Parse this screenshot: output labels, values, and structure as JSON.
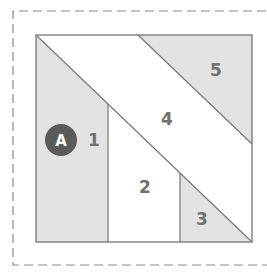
{
  "diagram": {
    "type": "quilt-block-piecing-diagram",
    "colors": {
      "background": "#ffffff",
      "shaded_fill": "#e2e2e2",
      "outline": "#777777",
      "dashed_border": "#8a8a8a",
      "label_text": "#707070",
      "badge_fill": "#5a5a5a",
      "badge_text": "#ffffff"
    },
    "badge": {
      "label": "A"
    },
    "regions": [
      {
        "id": "1",
        "label": "1",
        "shaded": true
      },
      {
        "id": "2",
        "label": "2",
        "shaded": false
      },
      {
        "id": "3",
        "label": "3",
        "shaded": true
      },
      {
        "id": "4",
        "label": "4",
        "shaded": false
      },
      {
        "id": "5",
        "label": "5",
        "shaded": true
      }
    ]
  }
}
